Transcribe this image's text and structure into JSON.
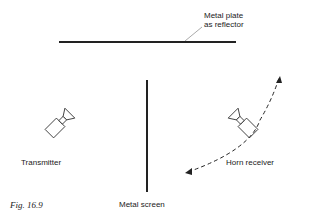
{
  "labels": {
    "reflector_line1": "Metal plate",
    "reflector_line2": "as reflector",
    "transmitter": "Transmitter",
    "receiver": "Horn receiver",
    "screen": "Metal screen",
    "caption": "Fig. 16.9"
  },
  "colors": {
    "ink": "#222222",
    "background": "#ffffff"
  }
}
